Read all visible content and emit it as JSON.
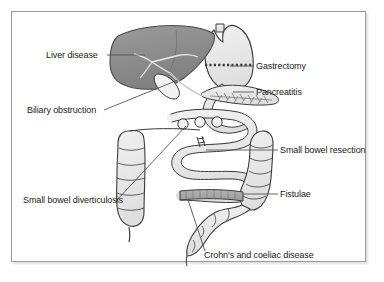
{
  "figure": {
    "background_color": "#ffffff",
    "frame_border_color": "#9a9a9a"
  },
  "palette": {
    "liver_fill": "#8e8e8e",
    "organ_fill": "#e8e8e8",
    "organ_stroke": "#3b3b3b",
    "inflamed_fill": "#a8a8a8",
    "leader_line": "#555555",
    "text": "#1a1a1a"
  },
  "labels": [
    {
      "id": "liver-disease",
      "text": "Liver disease",
      "x": 46,
      "y": 50
    },
    {
      "id": "biliary-obstruction",
      "text": "Biliary obstruction",
      "x": 27,
      "y": 112
    },
    {
      "id": "gastrectomy",
      "text": "Gastrectomy",
      "x": 255,
      "y": 63
    },
    {
      "id": "pancreatitis",
      "text": "Pancreatitis",
      "x": 255,
      "y": 89
    },
    {
      "id": "small-bowel-resection",
      "text": "Small bowel resection",
      "x": 279,
      "y": 147
    },
    {
      "id": "fistulae",
      "text": "Fistulae",
      "x": 279,
      "y": 191
    },
    {
      "id": "small-bowel-diverticulosis",
      "text": "Small bowel diverticulosis",
      "x": 23,
      "y": 198
    },
    {
      "id": "crohns-coeliac",
      "text": "Crohn's and coeliac disease",
      "x": 203,
      "y": 254
    }
  ],
  "anatomy": [
    {
      "id": "liver",
      "name": "liver"
    },
    {
      "id": "gallbladder",
      "name": "gallbladder"
    },
    {
      "id": "bile-duct",
      "name": "bile-duct"
    },
    {
      "id": "stomach",
      "name": "stomach"
    },
    {
      "id": "gastrectomy-line",
      "name": "gastrectomy-resection-line"
    },
    {
      "id": "pancreas",
      "name": "pancreas"
    },
    {
      "id": "duodenum",
      "name": "duodenum"
    },
    {
      "id": "small-bowel",
      "name": "small-bowel-loops"
    },
    {
      "id": "diverticula",
      "name": "small-bowel-diverticula"
    },
    {
      "id": "resection-marker",
      "name": "small-bowel-resection-marker"
    },
    {
      "id": "ascending-colon",
      "name": "ascending-colon"
    },
    {
      "id": "transverse-colon",
      "name": "transverse-colon"
    },
    {
      "id": "descending-colon",
      "name": "descending-colon"
    },
    {
      "id": "sigmoid-colon",
      "name": "sigmoid-colon"
    },
    {
      "id": "caecum",
      "name": "caecum"
    },
    {
      "id": "appendix",
      "name": "appendix"
    },
    {
      "id": "terminal-ileum",
      "name": "inflamed-terminal-ileum"
    }
  ]
}
